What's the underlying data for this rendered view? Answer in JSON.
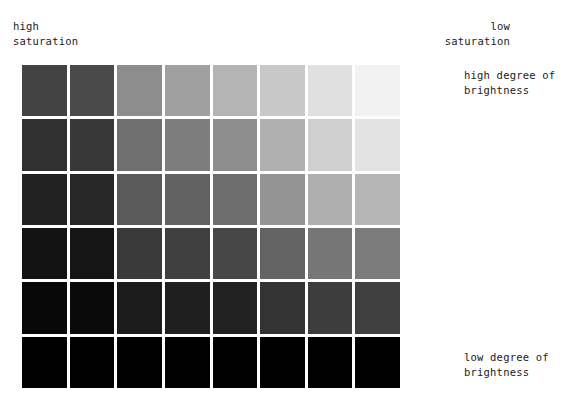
{
  "figure": {
    "labels": {
      "top_left": "high\nsaturation",
      "top_right": "low\nsaturation",
      "right_top": "high degree of\nbrightness",
      "right_bottom": "low degree of\nbrightness"
    },
    "background_color": "#ffffff",
    "text_color": "#1b1b1b",
    "gap_color": "#ffffff"
  },
  "chart_data": {
    "type": "heatmap",
    "title": "",
    "subtitle": "",
    "xlabel": "saturation",
    "ylabel": "degree of brightness",
    "grid": false,
    "legend_position": "none",
    "columns": 8,
    "rows": 6,
    "x_axis_direction": "high saturation (left) to low saturation (right)",
    "y_axis_direction": "high degree of brightness (top) to low degree of brightness (bottom)",
    "annotations": [
      "high saturation",
      "low saturation",
      "high degree of brightness",
      "low degree of brightness"
    ],
    "column_labels": [
      "1",
      "2",
      "3",
      "4",
      "5",
      "6",
      "7",
      "8"
    ],
    "row_labels": [
      "1",
      "2",
      "3",
      "4",
      "5",
      "6"
    ],
    "cells": [
      [
        "#434343",
        "#4a4a4a",
        "#8d8d8d",
        "#a0a0a0",
        "#b4b4b4",
        "#c8c8c8",
        "#e0e0e0",
        "#f2f2f2"
      ],
      [
        "#303030",
        "#383838",
        "#6f6f6f",
        "#7d7d7d",
        "#8e8e8e",
        "#b0b0b0",
        "#cfcfcf",
        "#e3e3e3"
      ],
      [
        "#222222",
        "#272727",
        "#5a5a5a",
        "#626262",
        "#6e6e6e",
        "#949494",
        "#aeaeae",
        "#b6b6b6"
      ],
      [
        "#131313",
        "#151515",
        "#3a3a3a",
        "#404040",
        "#474747",
        "#636363",
        "#767676",
        "#7b7b7b"
      ],
      [
        "#080808",
        "#0a0a0a",
        "#1c1c1c",
        "#1f1f1f",
        "#222222",
        "#333333",
        "#3d3d3d",
        "#404040"
      ],
      [
        "#000000",
        "#000000",
        "#000000",
        "#000000",
        "#000000",
        "#000000",
        "#000000",
        "#000000"
      ]
    ],
    "values": [
      [
        26,
        29,
        55,
        63,
        71,
        78,
        88,
        95
      ],
      [
        19,
        22,
        44,
        49,
        56,
        69,
        81,
        89
      ],
      [
        13,
        15,
        35,
        38,
        43,
        58,
        68,
        71
      ],
      [
        7,
        8,
        23,
        25,
        28,
        39,
        46,
        48
      ],
      [
        3,
        4,
        11,
        12,
        13,
        20,
        24,
        25
      ],
      [
        0,
        0,
        0,
        0,
        0,
        0,
        0,
        0
      ]
    ],
    "value_unit": "percent lightness"
  }
}
